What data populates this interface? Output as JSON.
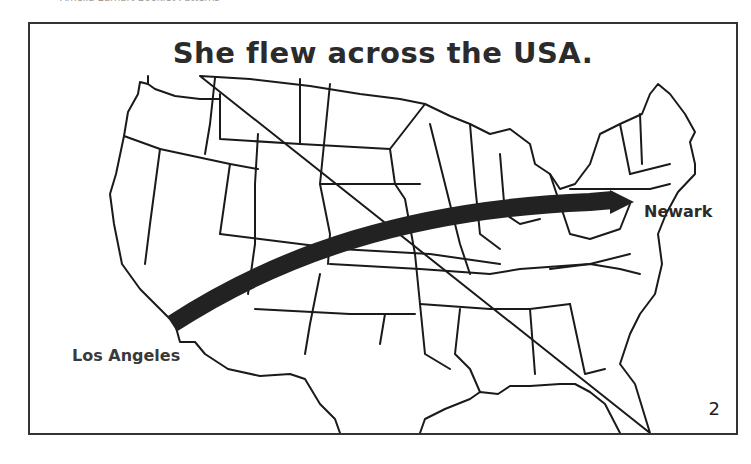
{
  "header": {
    "text": "Amelia Earhart Booklet Patterns"
  },
  "page": {
    "title": "She flew across the USA.",
    "page_number": "2"
  },
  "map": {
    "region": "Continental United States outline map",
    "origin": {
      "label": "Los Angeles"
    },
    "destination": {
      "label": "Newark"
    },
    "arrow": {
      "from": "Los Angeles",
      "to": "Newark",
      "color": "#222222"
    }
  }
}
